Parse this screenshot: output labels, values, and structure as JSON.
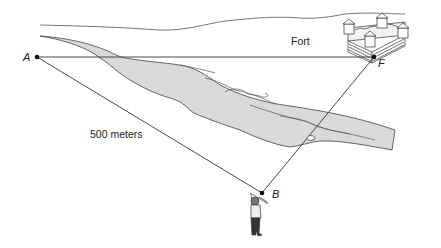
{
  "diagram": {
    "type": "surveying-triangle",
    "points": {
      "A": {
        "label": "A",
        "x": 37,
        "y": 57
      },
      "F": {
        "label": "F",
        "x": 374,
        "y": 57
      },
      "B": {
        "label": "B",
        "x": 262,
        "y": 193
      }
    },
    "labels": {
      "fort": "Fort",
      "distance_AB": "500 meters"
    },
    "colors": {
      "line": "#333333",
      "river_fill": "#d9d9d9",
      "river_edge": "#444444"
    }
  }
}
